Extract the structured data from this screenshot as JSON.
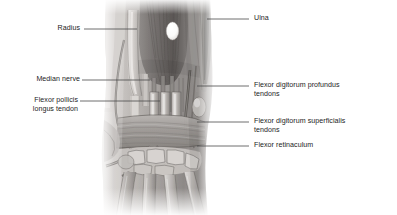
{
  "figure": {
    "kind": "anatomical-illustration",
    "background_color": "#ffffff",
    "ink_color": "#1c1c1c",
    "leader_color": "#4a4a4a",
    "illustration": {
      "tone_light": "#e8e6e4",
      "tone_mid": "#b3afad",
      "tone_dark": "#6e6a68",
      "tone_darkest": "#3d3a39",
      "highlight": "#ffffff"
    },
    "labels": [
      {
        "id": "radius",
        "text": "Radius",
        "side": "left",
        "text_x": 46,
        "text_y": 24,
        "leader": {
          "x1": 84,
          "y1": 29,
          "x2": 137,
          "y2": 29
        }
      },
      {
        "id": "ulna",
        "text": "Ulna",
        "side": "right",
        "text_x": 254,
        "text_y": 14,
        "leader": {
          "x1": 207,
          "y1": 19,
          "x2": 249,
          "y2": 19
        }
      },
      {
        "id": "median-nerve",
        "text": "Median nerve",
        "side": "left",
        "text_x": 17,
        "text_y": 75,
        "leader": {
          "x1": 82,
          "y1": 80,
          "x2": 150,
          "y2": 80
        }
      },
      {
        "id": "flexor-pollicis-longus-tendon",
        "text": "Flexor pollicis\nlongus tendon",
        "side": "left",
        "text_x": 18,
        "text_y": 96,
        "leader": {
          "x1": 80,
          "y1": 101,
          "x2": 160,
          "y2": 101
        }
      },
      {
        "id": "flexor-digitorum-profundus-tendons",
        "text": "Flexor digitorum profundus\ntendons",
        "side": "right",
        "text_x": 254,
        "text_y": 81,
        "leader": {
          "x1": 197,
          "y1": 86,
          "x2": 249,
          "y2": 86
        }
      },
      {
        "id": "flexor-digitorum-superficialis-tendons",
        "text": "Flexor digitorum superficialis\ntendons",
        "side": "right",
        "text_x": 254,
        "text_y": 117,
        "leader": {
          "x1": 197,
          "y1": 122,
          "x2": 249,
          "y2": 122
        }
      },
      {
        "id": "flexor-retinaculum",
        "text": "Flexor retinaculum",
        "side": "right",
        "text_x": 254,
        "text_y": 141,
        "leader": {
          "x1": 197,
          "y1": 146,
          "x2": 249,
          "y2": 146
        }
      }
    ]
  }
}
